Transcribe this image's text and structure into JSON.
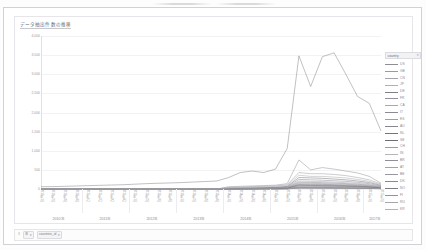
{
  "window": {
    "title_bar_visible": false
  },
  "chart": {
    "title": "データ抽出件数の推移",
    "legend": {
      "header_label": "country",
      "header_icon": "chevron-down-icon",
      "entries": [
        {
          "label": "US",
          "color": "#8d8d93"
        },
        {
          "label": "GB",
          "color": "#9a9aa0"
        },
        {
          "label": "CN",
          "color": "#a4a4aa"
        },
        {
          "label": "JP",
          "color": "#b0b0b6"
        },
        {
          "label": "DE",
          "color": "#7e7e85"
        },
        {
          "label": "FR",
          "color": "#9090a0"
        },
        {
          "label": "CA",
          "color": "#a8a8ae"
        },
        {
          "label": "IT",
          "color": "#8b8b92"
        },
        {
          "label": "ES",
          "color": "#9e9ea4"
        },
        {
          "label": "AU",
          "color": "#86868d"
        },
        {
          "label": "NL",
          "color": "#74747b"
        },
        {
          "label": "SE",
          "color": "#6e6e76"
        },
        {
          "label": "CH",
          "color": "#9c9ca2"
        },
        {
          "label": "IN",
          "color": "#b4b4ba"
        },
        {
          "label": "BR",
          "color": "#8f8f96"
        },
        {
          "label": "AT",
          "color": "#a2a2a8"
        },
        {
          "label": "BE",
          "color": "#97979e"
        },
        {
          "label": "DK",
          "color": "#89898f"
        },
        {
          "label": "NO",
          "color": "#7b7b82"
        },
        {
          "label": "FI",
          "color": "#9494a0"
        },
        {
          "label": "RU",
          "color": "#a6a6ac"
        },
        {
          "label": "KR",
          "color": "#b2b2b8"
        }
      ]
    }
  },
  "bottom_bar": {
    "grip_icon": "grip-icon",
    "controls": [
      {
        "label": "年",
        "icon": "chevron-down-icon"
      },
      {
        "label": "countries_id",
        "icon": "chevron-down-icon"
      }
    ]
  },
  "chart_data": {
    "type": "line",
    "title": "データ抽出件数の推移",
    "xlabel": "",
    "ylabel": "",
    "ylim": [
      0,
      4000
    ],
    "yticks": [
      0,
      500,
      1000,
      1500,
      2000,
      2500,
      3000,
      3500,
      4000
    ],
    "grid": true,
    "legend_position": "right",
    "year_groups": [
      "2010年",
      "2011年",
      "2012年",
      "2013年",
      "2014年",
      "2015年",
      "2016年",
      "2017年"
    ],
    "x": [
      "2010年1Q",
      "2010年2Q",
      "2010年3Q",
      "2010年4Q",
      "2011年1Q",
      "2011年2Q",
      "2011年3Q",
      "2011年4Q",
      "2012年1Q",
      "2012年2Q",
      "2012年3Q",
      "2012年4Q",
      "2013年1Q",
      "2013年2Q",
      "2013年3Q",
      "2013年4Q",
      "2014年1Q",
      "2014年2Q",
      "2014年3Q",
      "2014年4Q",
      "2015年1Q",
      "2015年2Q",
      "2015年3Q",
      "2015年4Q",
      "2016年1Q",
      "2016年2Q",
      "2016年3Q",
      "2016年4Q",
      "2017年1Q",
      "2017年2Q"
    ],
    "series": [
      {
        "name": "US",
        "color": "#8d8d93",
        "values": [
          60,
          62,
          70,
          78,
          88,
          96,
          104,
          112,
          126,
          140,
          150,
          158,
          168,
          182,
          196,
          210,
          300,
          430,
          470,
          430,
          520,
          1060,
          3480,
          2680,
          3460,
          3560,
          3000,
          2420,
          2240,
          1520
        ]
      },
      {
        "name": "GB",
        "color": "#9a9aa0",
        "values": [
          0,
          0,
          0,
          0,
          0,
          0,
          0,
          0,
          0,
          0,
          0,
          0,
          0,
          0,
          0,
          0,
          60,
          70,
          80,
          90,
          100,
          140,
          760,
          500,
          560,
          520,
          470,
          420,
          330,
          150
        ]
      },
      {
        "name": "CN",
        "color": "#a4a4aa",
        "values": [
          0,
          0,
          0,
          0,
          0,
          0,
          0,
          0,
          0,
          0,
          0,
          0,
          0,
          0,
          0,
          0,
          40,
          50,
          60,
          70,
          80,
          110,
          430,
          400,
          400,
          380,
          350,
          300,
          240,
          130
        ]
      },
      {
        "name": "JP",
        "color": "#b0b0b6",
        "values": [
          0,
          0,
          0,
          0,
          0,
          0,
          0,
          0,
          0,
          0,
          0,
          0,
          0,
          0,
          0,
          0,
          30,
          40,
          45,
          55,
          65,
          90,
          360,
          330,
          330,
          310,
          290,
          250,
          200,
          110
        ]
      },
      {
        "name": "DE",
        "color": "#7e7e85",
        "values": [
          0,
          0,
          0,
          0,
          0,
          0,
          0,
          0,
          0,
          0,
          0,
          0,
          0,
          0,
          0,
          0,
          20,
          25,
          30,
          35,
          45,
          70,
          300,
          290,
          280,
          260,
          240,
          210,
          170,
          95
        ]
      },
      {
        "name": "FR",
        "color": "#9090a0",
        "values": [
          0,
          0,
          0,
          0,
          0,
          0,
          0,
          0,
          0,
          0,
          0,
          0,
          0,
          0,
          0,
          0,
          15,
          20,
          25,
          30,
          38,
          60,
          250,
          240,
          230,
          215,
          200,
          175,
          140,
          80
        ]
      },
      {
        "name": "CA",
        "color": "#a8a8ae",
        "values": [
          0,
          0,
          0,
          0,
          0,
          0,
          0,
          0,
          0,
          0,
          0,
          0,
          0,
          0,
          0,
          0,
          12,
          16,
          20,
          26,
          32,
          50,
          210,
          200,
          195,
          180,
          165,
          145,
          115,
          65
        ]
      },
      {
        "name": "IT",
        "color": "#8b8b92",
        "values": [
          0,
          0,
          0,
          0,
          0,
          0,
          0,
          0,
          0,
          0,
          0,
          0,
          0,
          0,
          0,
          0,
          10,
          13,
          17,
          22,
          28,
          44,
          180,
          172,
          166,
          155,
          142,
          125,
          100,
          55
        ]
      },
      {
        "name": "ES",
        "color": "#9e9ea4",
        "values": [
          0,
          0,
          0,
          0,
          0,
          0,
          0,
          0,
          0,
          0,
          0,
          0,
          0,
          0,
          0,
          0,
          8,
          11,
          14,
          19,
          24,
          38,
          155,
          148,
          142,
          132,
          122,
          107,
          85,
          48
        ]
      },
      {
        "name": "AU",
        "color": "#86868d",
        "values": [
          0,
          0,
          0,
          0,
          0,
          0,
          0,
          0,
          0,
          0,
          0,
          0,
          0,
          0,
          0,
          0,
          7,
          9,
          12,
          16,
          21,
          33,
          132,
          126,
          121,
          113,
          104,
          91,
          73,
          41
        ]
      },
      {
        "name": "NL",
        "color": "#74747b",
        "values": [
          0,
          0,
          0,
          0,
          0,
          0,
          0,
          0,
          0,
          0,
          0,
          0,
          0,
          0,
          0,
          0,
          6,
          8,
          10,
          14,
          18,
          28,
          114,
          108,
          104,
          97,
          89,
          78,
          62,
          35
        ]
      },
      {
        "name": "SE",
        "color": "#6e6e76",
        "values": [
          0,
          0,
          0,
          0,
          0,
          0,
          0,
          0,
          0,
          0,
          0,
          0,
          0,
          0,
          0,
          0,
          5,
          7,
          9,
          12,
          15,
          24,
          98,
          93,
          89,
          83,
          77,
          67,
          54,
          30
        ]
      },
      {
        "name": "CH",
        "color": "#9c9ca2",
        "values": [
          0,
          0,
          0,
          0,
          0,
          0,
          0,
          0,
          0,
          0,
          0,
          0,
          0,
          0,
          0,
          0,
          4,
          6,
          8,
          10,
          13,
          21,
          84,
          80,
          77,
          72,
          66,
          58,
          46,
          26
        ]
      },
      {
        "name": "IN",
        "color": "#b4b4ba",
        "values": [
          0,
          0,
          0,
          0,
          0,
          0,
          0,
          0,
          0,
          0,
          0,
          0,
          0,
          0,
          0,
          0,
          4,
          5,
          7,
          9,
          11,
          18,
          72,
          69,
          66,
          62,
          57,
          50,
          40,
          22
        ]
      },
      {
        "name": "BR",
        "color": "#8f8f96",
        "values": [
          0,
          0,
          0,
          0,
          0,
          0,
          0,
          0,
          0,
          0,
          0,
          0,
          0,
          0,
          0,
          0,
          3,
          4,
          6,
          8,
          10,
          15,
          62,
          59,
          57,
          53,
          49,
          43,
          34,
          19
        ]
      },
      {
        "name": "AT",
        "color": "#a2a2a8",
        "values": [
          0,
          0,
          0,
          0,
          0,
          0,
          0,
          0,
          0,
          0,
          0,
          0,
          0,
          0,
          0,
          0,
          3,
          4,
          5,
          7,
          9,
          13,
          53,
          51,
          49,
          46,
          42,
          37,
          30,
          17
        ]
      },
      {
        "name": "BE",
        "color": "#97979e",
        "values": [
          0,
          0,
          0,
          0,
          0,
          0,
          0,
          0,
          0,
          0,
          0,
          0,
          0,
          0,
          0,
          0,
          2,
          3,
          4,
          6,
          7,
          11,
          46,
          44,
          42,
          39,
          36,
          32,
          25,
          14
        ]
      },
      {
        "name": "DK",
        "color": "#89898f",
        "values": [
          0,
          0,
          0,
          0,
          0,
          0,
          0,
          0,
          0,
          0,
          0,
          0,
          0,
          0,
          0,
          0,
          2,
          3,
          4,
          5,
          6,
          10,
          39,
          37,
          36,
          34,
          31,
          27,
          22,
          12
        ]
      },
      {
        "name": "NO",
        "color": "#7b7b82",
        "values": [
          0,
          0,
          0,
          0,
          0,
          0,
          0,
          0,
          0,
          0,
          0,
          0,
          0,
          0,
          0,
          0,
          2,
          2,
          3,
          4,
          5,
          8,
          34,
          32,
          31,
          29,
          27,
          23,
          19,
          10
        ]
      },
      {
        "name": "FI",
        "color": "#9494a0",
        "values": [
          0,
          0,
          0,
          0,
          0,
          0,
          0,
          0,
          0,
          0,
          0,
          0,
          0,
          0,
          0,
          0,
          1,
          2,
          3,
          4,
          5,
          7,
          29,
          28,
          27,
          25,
          23,
          20,
          16,
          9
        ]
      },
      {
        "name": "RU",
        "color": "#a6a6ac",
        "values": [
          0,
          0,
          0,
          0,
          0,
          0,
          0,
          0,
          0,
          0,
          0,
          0,
          0,
          0,
          0,
          0,
          1,
          2,
          2,
          3,
          4,
          6,
          25,
          24,
          23,
          21,
          20,
          17,
          14,
          8
        ]
      },
      {
        "name": "KR",
        "color": "#b2b2b8",
        "values": [
          0,
          0,
          0,
          0,
          0,
          0,
          0,
          0,
          0,
          0,
          0,
          0,
          0,
          0,
          0,
          0,
          1,
          1,
          2,
          3,
          3,
          5,
          21,
          20,
          19,
          18,
          17,
          15,
          12,
          7
        ]
      }
    ]
  }
}
